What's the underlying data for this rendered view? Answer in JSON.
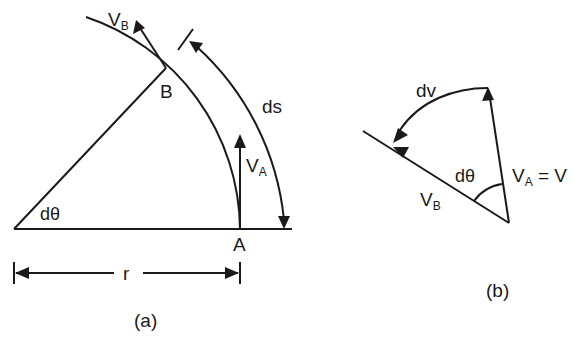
{
  "figure": {
    "panel_a": {
      "caption": "(a)",
      "labels": {
        "vb": "V",
        "vb_sub": "B",
        "b": "B",
        "ds": "ds",
        "va": "V",
        "va_sub": "A",
        "dtheta": "dθ",
        "a": "A",
        "r": "r"
      }
    },
    "panel_b": {
      "caption": "(b)",
      "labels": {
        "dv": "dv",
        "dtheta": "dθ",
        "va": "V",
        "va_sub": "A",
        "va_eq": " = V",
        "vb": "V",
        "vb_sub": "B"
      }
    },
    "colors": {
      "ink": "#1a1a1a",
      "background": "#ffffff"
    }
  }
}
